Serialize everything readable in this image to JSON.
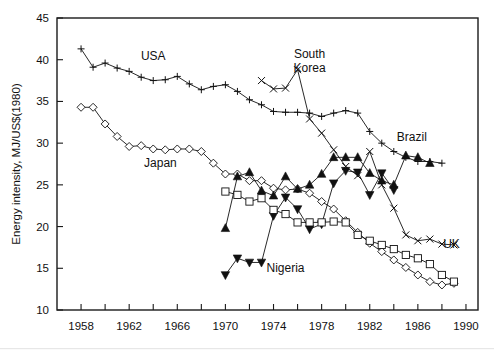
{
  "chart_data": {
    "type": "line",
    "title": "",
    "xlabel": "",
    "ylabel": "Energy intensity, MJ/US$(1980)",
    "xlim": [
      1956,
      1991
    ],
    "ylim": [
      10,
      45
    ],
    "ytick_step": 5,
    "yticks": [
      10,
      15,
      20,
      25,
      30,
      35,
      40,
      45
    ],
    "xticks": [
      1958,
      1962,
      1966,
      1970,
      1974,
      1978,
      1982,
      1986,
      1990
    ],
    "xminor_step": 2,
    "grid": false,
    "legend_position": "inline-annotations",
    "series": [
      {
        "name": "USA",
        "marker": "plus",
        "label_x": 1964.0,
        "label_y": 40.0,
        "x": [
          1958,
          1959,
          1960,
          1961,
          1962,
          1963,
          1964,
          1965,
          1966,
          1967,
          1968,
          1969,
          1970,
          1971,
          1972,
          1973,
          1974,
          1975,
          1976,
          1977,
          1978,
          1979,
          1980,
          1981,
          1982,
          1983,
          1984,
          1985,
          1986,
          1987,
          1988
        ],
        "y": [
          41.3,
          39.1,
          39.6,
          39.0,
          38.6,
          37.9,
          37.5,
          37.6,
          38.0,
          37.1,
          36.4,
          36.8,
          37.0,
          36.2,
          35.2,
          34.6,
          33.8,
          33.7,
          33.7,
          33.6,
          33.2,
          33.6,
          33.9,
          33.6,
          31.4,
          30.0,
          29.0,
          28.3,
          27.8,
          27.8,
          27.6
        ]
      },
      {
        "name": "Japan",
        "marker": "diamond",
        "label_x": 1964.6,
        "label_y": 27.1,
        "x": [
          1958,
          1959,
          1960,
          1961,
          1962,
          1963,
          1964,
          1965,
          1966,
          1967,
          1968,
          1969,
          1970,
          1971,
          1972,
          1973,
          1974,
          1975,
          1976,
          1977,
          1978,
          1979,
          1980,
          1981,
          1982,
          1983,
          1984,
          1985,
          1986,
          1987,
          1988,
          1989
        ],
        "y": [
          34.3,
          34.3,
          32.3,
          30.8,
          29.6,
          29.7,
          29.3,
          29.2,
          29.3,
          29.3,
          29.0,
          27.6,
          26.3,
          26.3,
          25.5,
          25.5,
          24.6,
          24.4,
          24.5,
          24.0,
          23.0,
          22.1,
          20.7,
          19.3,
          18.0,
          17.0,
          16.0,
          15.1,
          14.2,
          13.4,
          13.0,
          13.2
        ]
      },
      {
        "name": "South Korea",
        "marker": "cross",
        "label_x": 1977.0,
        "label_y": 40.2,
        "x": [
          1973,
          1974,
          1975,
          1976,
          1977,
          1978,
          1979,
          1980,
          1981,
          1982,
          1983,
          1984,
          1985,
          1986,
          1987,
          1988,
          1989
        ],
        "y": [
          37.5,
          36.5,
          36.6,
          38.8,
          32.9,
          31.2,
          29.2,
          27.2,
          26.1,
          29.0,
          25.0,
          22.2,
          19.0,
          18.3,
          18.5,
          17.9,
          17.8
        ]
      },
      {
        "name": "Brazil",
        "marker": "triangle-up",
        "label_x": 1985.5,
        "label_y": 30.2,
        "x": [
          1970,
          1971,
          1972,
          1973,
          1974,
          1975,
          1976,
          1977,
          1978,
          1979,
          1980,
          1981,
          1982,
          1983,
          1984,
          1985,
          1986,
          1987
        ],
        "y": [
          19.8,
          26.0,
          26.5,
          24.3,
          23.7,
          26.0,
          24.5,
          25.0,
          26.3,
          28.3,
          28.3,
          28.3,
          26.4,
          25.5,
          25.0,
          28.5,
          28.3,
          27.6
        ]
      },
      {
        "name": "Nigeria",
        "marker": "triangle-down",
        "label_x": 1975.0,
        "label_y": 14.6,
        "x": [
          1970,
          1971,
          1972,
          1973,
          1974,
          1975,
          1976,
          1977,
          1978,
          1979,
          1980,
          1981,
          1982,
          1983,
          1984
        ],
        "y": [
          14.2,
          16.2,
          15.7,
          15.7,
          21.3,
          23.5,
          22.1,
          19.7,
          20.3,
          25.2,
          26.7,
          26.5,
          23.8,
          26.4,
          24.4
        ]
      },
      {
        "name": "UK",
        "marker": "square",
        "label_x": 1988.8,
        "label_y": 17.4,
        "x": [
          1970,
          1971,
          1972,
          1973,
          1974,
          1975,
          1976,
          1977,
          1978,
          1979,
          1980,
          1981,
          1982,
          1983,
          1984,
          1985,
          1986,
          1987,
          1988,
          1989
        ],
        "y": [
          24.2,
          23.8,
          23.0,
          23.4,
          22.0,
          21.5,
          20.5,
          20.5,
          20.5,
          20.6,
          20.5,
          19.0,
          18.3,
          17.8,
          17.3,
          16.6,
          16.2,
          15.5,
          14.2,
          13.4
        ]
      }
    ]
  }
}
